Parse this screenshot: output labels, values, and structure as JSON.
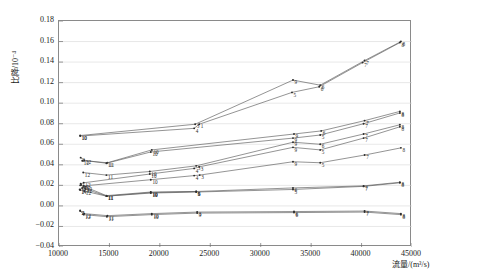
{
  "chart_data": {
    "type": "line",
    "title": "",
    "xlabel": "流量/(m³/s)",
    "ylabel": "比降/10⁻⁴",
    "xlim": [
      10000,
      45000
    ],
    "ylim": [
      -0.04,
      0.18
    ],
    "xticks": [
      10000,
      15000,
      20000,
      25000,
      30000,
      35000,
      40000,
      45000
    ],
    "yticks": [
      -0.04,
      -0.02,
      0.0,
      0.02,
      0.04,
      0.06,
      0.08,
      0.1,
      0.12,
      0.14,
      0.16,
      0.18
    ],
    "xtick_labels": [
      "10000",
      "15000",
      "20000",
      "25000",
      "30000",
      "35000",
      "40000",
      "45000"
    ],
    "ytick_labels": [
      "-0.04",
      "-0.02",
      "0.00",
      "0.02",
      "0.04",
      "0.06",
      "0.08",
      "0.10",
      "0.12",
      "0.14",
      "0.16",
      "0.18"
    ],
    "grid": true,
    "grid_axis": "y",
    "legend": "none",
    "point_labels_enabled": true,
    "series": [
      {
        "name": "S1",
        "point_labels": [
          "10",
          "3",
          "9",
          "6",
          "7",
          "8"
        ],
        "x": [
          12100,
          23500,
          33200,
          35900,
          40300,
          43900
        ],
        "y": [
          0.0685,
          0.0795,
          0.1225,
          0.1175,
          0.1415,
          0.16
        ]
      },
      {
        "name": "S2",
        "point_labels": [
          "10",
          "4",
          "1",
          "5",
          "6",
          "7",
          "8"
        ],
        "x": [
          12100,
          23400,
          23900,
          33100,
          35800,
          40100,
          43800
        ],
        "y": [
          0.068,
          0.0755,
          0.0795,
          0.1105,
          0.116,
          0.1395,
          0.159
        ]
      },
      {
        "name": "S3",
        "point_labels": [
          "12",
          "11",
          "10",
          "9",
          "6",
          "7",
          "8"
        ],
        "x": [
          12300,
          14800,
          19200,
          33300,
          36000,
          40300,
          43800
        ],
        "y": [
          0.044,
          0.042,
          0.0545,
          0.07,
          0.073,
          0.083,
          0.092
        ]
      },
      {
        "name": "S4",
        "point_labels": [
          "2",
          "12",
          "11",
          "10",
          "9",
          "5",
          "7",
          "8"
        ],
        "x": [
          12150,
          12500,
          14700,
          19100,
          33200,
          35900,
          40200,
          43800
        ],
        "y": [
          0.047,
          0.0445,
          0.0415,
          0.0525,
          0.066,
          0.069,
          0.08,
          0.0905
        ]
      },
      {
        "name": "S5",
        "point_labels": [
          "12",
          "11",
          "10",
          "3",
          "9",
          "6",
          "7",
          "8"
        ],
        "x": [
          12400,
          14700,
          19000,
          23600,
          33200,
          35900,
          40200,
          43800
        ],
        "y": [
          0.0325,
          0.03,
          0.0335,
          0.039,
          0.062,
          0.06,
          0.07,
          0.079
        ]
      },
      {
        "name": "S6",
        "point_labels": [
          "1",
          "12",
          "10",
          "4",
          "3",
          "9",
          "5",
          "7",
          "8"
        ],
        "x": [
          12150,
          12450,
          19000,
          23400,
          23900,
          33200,
          35900,
          40200,
          43800
        ],
        "y": [
          0.0215,
          0.0225,
          0.031,
          0.0365,
          0.038,
          0.057,
          0.0545,
          0.066,
          0.077
        ]
      },
      {
        "name": "S7",
        "point_labels": [
          "2",
          "12",
          "10",
          "4",
          "3",
          "9",
          "5",
          "7",
          "8"
        ],
        "x": [
          12100,
          12450,
          19100,
          23400,
          23950,
          33200,
          35900,
          40300,
          43900
        ],
        "y": [
          0.02,
          0.0195,
          0.0255,
          0.0295,
          0.03,
          0.043,
          0.042,
          0.0495,
          0.0565
        ]
      },
      {
        "name": "S8",
        "point_labels": [
          "14",
          "13",
          "12",
          "11",
          "10",
          "5",
          "6",
          "7",
          "8"
        ],
        "x": [
          12050,
          12300,
          12600,
          14700,
          19100,
          23600,
          33200,
          40200,
          43800
        ],
        "y": [
          0.016,
          0.0175,
          0.0185,
          0.01,
          0.0135,
          0.014,
          0.0175,
          0.0195,
          0.023
        ]
      },
      {
        "name": "S9",
        "point_labels": [
          "1",
          "12",
          "11",
          "10",
          "6",
          "5",
          "7",
          "8"
        ],
        "x": [
          12100,
          12500,
          14700,
          19100,
          23600,
          33200,
          40200,
          43800
        ],
        "y": [
          0.0155,
          0.0145,
          0.0095,
          0.0125,
          0.0135,
          0.016,
          0.019,
          0.0225
        ]
      },
      {
        "name": "S10",
        "point_labels": [
          "2",
          "12",
          "11",
          "10",
          "3",
          "6",
          "7",
          "8"
        ],
        "x": [
          12100,
          12500,
          14800,
          19200,
          23700,
          33300,
          40300,
          43900
        ],
        "y": [
          -0.0045,
          -0.0075,
          -0.0095,
          -0.0075,
          -0.006,
          -0.0055,
          -0.005,
          -0.0075
        ]
      },
      {
        "name": "S11",
        "point_labels": [
          "2",
          "12",
          "11",
          "10",
          "9",
          "6",
          "7",
          "8"
        ],
        "x": [
          12100,
          12450,
          14750,
          19200,
          23700,
          33300,
          40300,
          43900
        ],
        "y": [
          -0.005,
          -0.0085,
          -0.0105,
          -0.0085,
          -0.007,
          -0.0065,
          -0.006,
          -0.0085
        ]
      },
      {
        "name": "S12",
        "point_labels": [
          "13",
          "12",
          "11",
          "10",
          "9"
        ],
        "x": [
          12200,
          12600,
          14750,
          19100,
          23600
        ],
        "y": [
          0.0205,
          0.0165,
          0.0095,
          0.013,
          0.014
        ]
      }
    ]
  }
}
